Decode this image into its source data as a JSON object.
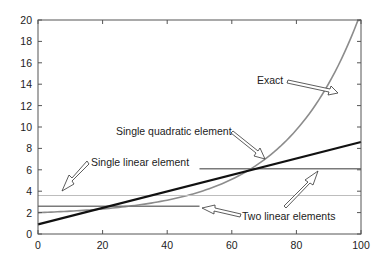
{
  "chart_data": {
    "type": "line",
    "title": "",
    "xlabel": "",
    "ylabel": "",
    "xlim": [
      0,
      100
    ],
    "ylim": [
      0,
      20
    ],
    "grid": false,
    "legend": "none (inline arrow annotations)",
    "x_ticks": [
      "0",
      "20",
      "40",
      "60",
      "80",
      "100"
    ],
    "y_ticks": [
      "0",
      "2",
      "4",
      "6",
      "8",
      "10",
      "12",
      "14",
      "16",
      "18",
      "20"
    ],
    "series": [
      {
        "name": "Exact",
        "color": "#8c8c8c",
        "x": [
          0,
          10,
          20,
          30,
          40,
          50,
          60,
          70,
          80,
          90,
          100
        ],
        "values": [
          2.0,
          2.1,
          2.4,
          2.8,
          3.3,
          4.0,
          5.0,
          6.4,
          8.5,
          12.0,
          20.0
        ]
      },
      {
        "name": "Single linear element",
        "color": "#111111",
        "x": [
          0,
          100
        ],
        "values": [
          0.9,
          8.6
        ]
      },
      {
        "name": "Single quadratic element",
        "color": "#bdbdbd",
        "x": [
          0,
          100
        ],
        "values": [
          3.6,
          3.6
        ]
      },
      {
        "name": "Two linear elements",
        "color": "#7a7a7a",
        "segments": [
          {
            "x": [
              0,
              50
            ],
            "values": [
              2.6,
              2.6
            ]
          },
          {
            "x": [
              50,
              100
            ],
            "values": [
              6.1,
              6.1
            ]
          }
        ]
      }
    ],
    "annotations": [
      {
        "text": "Exact",
        "points_to": [
          95,
          14
        ]
      },
      {
        "text": "Single quadratic element",
        "points_to": [
          74,
          7
        ]
      },
      {
        "text": "Single linear element",
        "points_to": [
          7,
          4
        ]
      },
      {
        "text": "Two linear elements",
        "points_to": [
          [
            51,
            2.6
          ],
          [
            87,
            6.1
          ]
        ]
      }
    ]
  }
}
